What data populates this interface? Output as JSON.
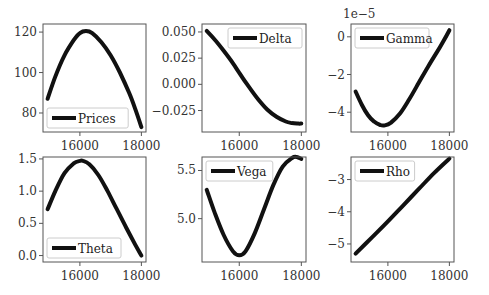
{
  "figure": {
    "width": 489,
    "height": 295,
    "line_color": "#111111",
    "axes_color": "#555555"
  },
  "chart_data": [
    {
      "type": "line",
      "title": "",
      "legend": "Prices",
      "legend_position": "lower left",
      "xlabel": "",
      "ylabel": "",
      "xlim": [
        14800,
        18150
      ],
      "ylim": [
        70.6,
        124
      ],
      "xticks": [
        16000,
        18000
      ],
      "xtick_labels": [
        "16000",
        "18000"
      ],
      "yticks": [
        80,
        100,
        120
      ],
      "ytick_labels": [
        "80",
        "100",
        "120"
      ],
      "grid": false,
      "x": [
        14950,
        15200,
        15500,
        15800,
        16000,
        16200,
        16400,
        16700,
        17000,
        17300,
        17600,
        17800,
        18000
      ],
      "y": [
        87,
        98,
        108.5,
        116,
        119.5,
        120.5,
        119.5,
        115,
        108.5,
        100,
        90,
        82,
        73
      ]
    },
    {
      "type": "line",
      "title": "",
      "legend": "Delta",
      "legend_position": "upper right",
      "xlim": [
        14800,
        18150
      ],
      "ylim": [
        -0.0455,
        0.0576
      ],
      "xticks": [
        16000,
        18000
      ],
      "xtick_labels": [
        "16000",
        "18000"
      ],
      "yticks": [
        -0.025,
        0.0,
        0.025,
        0.05
      ],
      "ytick_labels": [
        "−0.025",
        "0.000",
        "0.025",
        "0.050"
      ],
      "grid": false,
      "x": [
        14950,
        15200,
        15500,
        15800,
        16000,
        16300,
        16600,
        16900,
        17200,
        17500,
        17700,
        17900,
        18000
      ],
      "y": [
        0.051,
        0.043,
        0.032,
        0.02,
        0.011,
        -0.002,
        -0.014,
        -0.024,
        -0.031,
        -0.0355,
        -0.037,
        -0.0375,
        -0.0375
      ]
    },
    {
      "type": "line",
      "title": "",
      "legend": "Gamma",
      "legend_position": "upper left",
      "offset_text": "1e−5",
      "xlim": [
        14800,
        18150
      ],
      "ylim": [
        -5.05,
        0.68
      ],
      "xticks": [
        16000,
        18000
      ],
      "xtick_labels": [
        "16000",
        "18000"
      ],
      "yticks": [
        -4,
        -2,
        0
      ],
      "ytick_labels": [
        "−4",
        "−2",
        "0"
      ],
      "grid": false,
      "x": [
        14950,
        15150,
        15350,
        15550,
        15750,
        15900,
        16100,
        16400,
        16700,
        17000,
        17300,
        17600,
        17800,
        18000
      ],
      "y": [
        -2.9,
        -3.6,
        -4.15,
        -4.5,
        -4.68,
        -4.7,
        -4.55,
        -4.05,
        -3.3,
        -2.45,
        -1.6,
        -0.8,
        -0.25,
        0.35
      ]
    },
    {
      "type": "line",
      "title": "",
      "legend": "Theta",
      "legend_position": "lower left",
      "xlim": [
        14800,
        18150
      ],
      "ylim": [
        -0.1,
        1.53
      ],
      "xticks": [
        16000,
        18000
      ],
      "xtick_labels": [
        "16000",
        "18000"
      ],
      "yticks": [
        0.0,
        0.5,
        1.0,
        1.5
      ],
      "ytick_labels": [
        "0.0",
        "0.5",
        "1.0",
        "1.5"
      ],
      "grid": false,
      "x": [
        14950,
        15200,
        15500,
        15800,
        16000,
        16100,
        16300,
        16600,
        16900,
        17200,
        17500,
        17800,
        18000
      ],
      "y": [
        0.72,
        1.0,
        1.28,
        1.43,
        1.47,
        1.47,
        1.42,
        1.25,
        1.0,
        0.72,
        0.44,
        0.17,
        0.0
      ]
    },
    {
      "type": "line",
      "title": "",
      "legend": "Vega",
      "legend_position": "upper left",
      "xlim": [
        14800,
        18150
      ],
      "ylim": [
        4.55,
        5.64
      ],
      "xticks": [
        16000,
        18000
      ],
      "xtick_labels": [
        "16000",
        "18000"
      ],
      "yticks": [
        5.0,
        5.5
      ],
      "ytick_labels": [
        "5.0",
        "5.5"
      ],
      "grid": false,
      "x": [
        14950,
        15200,
        15500,
        15800,
        16000,
        16200,
        16500,
        16800,
        17100,
        17400,
        17700,
        17850,
        18000
      ],
      "y": [
        5.3,
        5.07,
        4.83,
        4.66,
        4.62,
        4.66,
        4.85,
        5.1,
        5.35,
        5.54,
        5.63,
        5.64,
        5.62
      ]
    },
    {
      "type": "line",
      "title": "",
      "legend": "Rho",
      "legend_position": "upper left",
      "xlim": [
        14800,
        18150
      ],
      "ylim": [
        -5.56,
        -2.3
      ],
      "xticks": [
        16000,
        18000
      ],
      "xtick_labels": [
        "16000",
        "18000"
      ],
      "yticks": [
        -5,
        -4,
        -3
      ],
      "ytick_labels": [
        "−5",
        "−4",
        "−3"
      ],
      "grid": false,
      "x": [
        14950,
        15500,
        16000,
        16500,
        17000,
        17500,
        18000
      ],
      "y": [
        -5.3,
        -4.78,
        -4.3,
        -3.8,
        -3.3,
        -2.8,
        -2.35
      ]
    }
  ]
}
